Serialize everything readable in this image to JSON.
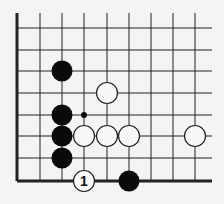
{
  "diagram": {
    "type": "go-board-fragment",
    "grid": {
      "x_lines": [
        17,
        40,
        62,
        84,
        107,
        129,
        151,
        173,
        195
      ],
      "y_lines": [
        28,
        50,
        71,
        93,
        115,
        136,
        158,
        181
      ],
      "top_extent": 13,
      "right_extent": 212,
      "left_edge_x": 17,
      "bottom_edge_y": 181
    },
    "colors": {
      "line": "#222222",
      "black_stone": "#0a0a0a",
      "white_stone": "#f8f8f8",
      "background": "#f4f4f4"
    },
    "stones": [
      {
        "color": "black",
        "col": 2,
        "row": 2
      },
      {
        "color": "black",
        "col": 2,
        "row": 4
      },
      {
        "color": "black",
        "col": 2,
        "row": 5
      },
      {
        "color": "black",
        "col": 2,
        "row": 6
      },
      {
        "color": "black",
        "col": 5,
        "row": 7
      },
      {
        "color": "white",
        "col": 4,
        "row": 3
      },
      {
        "color": "white",
        "col": 3,
        "row": 5
      },
      {
        "color": "white",
        "col": 4,
        "row": 5
      },
      {
        "color": "white",
        "col": 5,
        "row": 5
      },
      {
        "color": "white",
        "col": 8,
        "row": 5
      },
      {
        "color": "white",
        "col": 3,
        "row": 7,
        "label": "1"
      }
    ],
    "markers": [
      {
        "type": "small-dot",
        "col": 3,
        "row": 4
      }
    ]
  }
}
